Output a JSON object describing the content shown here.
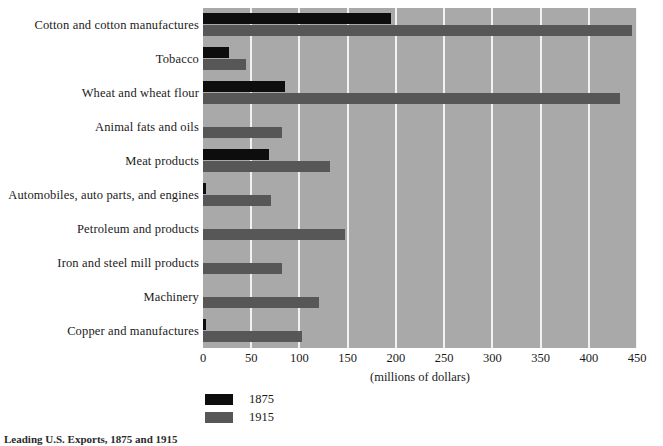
{
  "chart_data": {
    "type": "bar",
    "orientation": "horizontal",
    "title": "",
    "xlabel": "(millions of dollars)",
    "ylabel": "",
    "xlim": [
      0,
      450
    ],
    "xticks": [
      0,
      50,
      100,
      150,
      200,
      250,
      300,
      350,
      400,
      450
    ],
    "grid": "vertical-white-gridlines",
    "legend_position": "below-axis-left",
    "categories": [
      "Cotton and cotton manufactures",
      "Tobacco",
      "Wheat and wheat flour",
      "Animal fats and oils",
      "Meat products",
      "Automobiles, auto parts, and engines",
      "Petroleum and products",
      "Iron and steel mill products",
      "Machinery",
      "Copper and manufactures"
    ],
    "series": [
      {
        "name": "1875",
        "color": "#0d0d0d",
        "values": [
          195,
          27,
          85,
          0,
          68,
          3,
          0,
          0,
          0,
          3
        ]
      },
      {
        "name": "1915",
        "color": "#575757",
        "values": [
          445,
          45,
          432,
          82,
          132,
          70,
          147,
          82,
          120,
          103
        ]
      }
    ]
  },
  "axis": {
    "xlabel": "(millions of dollars)",
    "ticklabels": [
      "0",
      "50",
      "100",
      "150",
      "200",
      "250",
      "300",
      "350",
      "400",
      "450"
    ]
  },
  "legend": {
    "items": [
      {
        "label": "1875",
        "color": "#0d0d0d"
      },
      {
        "label": "1915",
        "color": "#575757"
      }
    ]
  },
  "caption": {
    "text": "Leading U.S. Exports, 1875 and 1915"
  },
  "colors": {
    "plot_background": "#a9a9a9",
    "gridline": "#f2f2f2",
    "series_1875": "#0d0d0d",
    "series_1915": "#575757"
  }
}
